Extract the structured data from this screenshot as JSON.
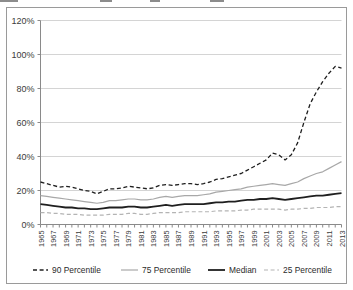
{
  "chart_data": {
    "type": "line",
    "title": "",
    "subtitle": "",
    "xlabel": "",
    "ylabel": "",
    "xlim": [
      1965,
      2013
    ],
    "ylim": [
      0,
      120
    ],
    "yticks": [
      "0%",
      "20%",
      "40%",
      "60%",
      "80%",
      "100%",
      "120%"
    ],
    "ytick_values": [
      0,
      20,
      40,
      60,
      80,
      100,
      120
    ],
    "grid": "horizontal",
    "legend_position": "bottom",
    "x": [
      1965,
      1966,
      1967,
      1968,
      1969,
      1970,
      1971,
      1972,
      1973,
      1974,
      1975,
      1976,
      1977,
      1978,
      1979,
      1980,
      1981,
      1982,
      1983,
      1984,
      1985,
      1986,
      1987,
      1988,
      1989,
      1990,
      1991,
      1992,
      1993,
      1994,
      1995,
      1996,
      1997,
      1998,
      1999,
      2000,
      2001,
      2002,
      2003,
      2004,
      2005,
      2006,
      2007,
      2008,
      2009,
      2010,
      2011,
      2012,
      2013
    ],
    "xticklabels": [
      "1965",
      "1967",
      "1969",
      "1971",
      "1973",
      "1975",
      "1977",
      "1979",
      "1981",
      "1983",
      "1985",
      "1987",
      "1989",
      "1991",
      "1993",
      "1995",
      "1997",
      "1999",
      "2001",
      "2003",
      "2005",
      "2007",
      "2009",
      "2011",
      "2013"
    ],
    "xticklabel_values": [
      1965,
      1967,
      1969,
      1971,
      1973,
      1975,
      1977,
      1979,
      1981,
      1983,
      1985,
      1987,
      1989,
      1991,
      1993,
      1995,
      1997,
      1999,
      2001,
      2003,
      2005,
      2007,
      2009,
      2011,
      2013
    ],
    "series": [
      {
        "name": "90 Percentile",
        "style": "dashed",
        "color": "#1f1f1f",
        "width": 1.3,
        "values": [
          25,
          24,
          23,
          22,
          22.5,
          22,
          21,
          20,
          19.5,
          18,
          19.5,
          21,
          21,
          21.5,
          22.5,
          22,
          21.5,
          21,
          21.5,
          23,
          23.5,
          23,
          23.5,
          24,
          24,
          23.5,
          24,
          25,
          26.5,
          27,
          28,
          29,
          30,
          32,
          34,
          36,
          38,
          42,
          41,
          38,
          41,
          48,
          60,
          71,
          78,
          84,
          89,
          93,
          92
        ]
      },
      {
        "name": "75 Percentile",
        "style": "solid",
        "color": "#a8a8a8",
        "width": 1.2,
        "values": [
          17,
          16.5,
          16,
          15.5,
          15,
          14.5,
          14,
          13.5,
          13,
          12.5,
          13,
          14,
          14,
          14.5,
          15,
          15,
          14.5,
          14.5,
          15,
          16,
          16.5,
          16,
          16.5,
          17,
          17,
          17,
          17.5,
          18,
          19,
          19.5,
          20,
          20.5,
          21,
          22,
          22.5,
          23,
          23.5,
          24,
          23.5,
          23,
          24,
          25,
          27,
          28.5,
          30,
          31,
          33,
          35,
          37
        ]
      },
      {
        "name": "Median",
        "style": "solid",
        "color": "#1f1f1f",
        "width": 1.8,
        "values": [
          12,
          11.5,
          11,
          10.5,
          10,
          10,
          9.5,
          9.5,
          9,
          9,
          9.5,
          10,
          10,
          10,
          10.5,
          10.5,
          10,
          10,
          10.5,
          11,
          11.5,
          11,
          11.5,
          12,
          12,
          12,
          12,
          12.5,
          13,
          13,
          13.5,
          13.5,
          14,
          14.5,
          14.5,
          15,
          15,
          15.5,
          15,
          14.5,
          15,
          15.5,
          16,
          16.5,
          17,
          17,
          17.5,
          18,
          18.5
        ]
      },
      {
        "name": "25 Percentile",
        "style": "dashed",
        "color": "#b4b4b4",
        "width": 1.2,
        "values": [
          7,
          7,
          6.5,
          6.5,
          6,
          6,
          6,
          5.5,
          5.5,
          5.5,
          5.5,
          6,
          6,
          6,
          6.5,
          6.5,
          6,
          6,
          6.5,
          7,
          7,
          7,
          7,
          7.5,
          7.5,
          7.5,
          7.5,
          7.5,
          8,
          8,
          8,
          8,
          8.5,
          8.5,
          9,
          9,
          9,
          9,
          9,
          8.5,
          9,
          9,
          9.5,
          9.5,
          10,
          10,
          10,
          10.5,
          10.5
        ]
      }
    ],
    "legend": [
      {
        "label": "90 Percentile",
        "style": "dashed",
        "color": "#1f1f1f",
        "width": 1.3
      },
      {
        "label": "75 Percentile",
        "style": "solid",
        "color": "#a8a8a8",
        "width": 1.2
      },
      {
        "label": "Median",
        "style": "solid",
        "color": "#1f1f1f",
        "width": 1.8
      },
      {
        "label": "25 Percentile",
        "style": "dashed",
        "color": "#b4b4b4",
        "width": 1.2
      }
    ]
  }
}
